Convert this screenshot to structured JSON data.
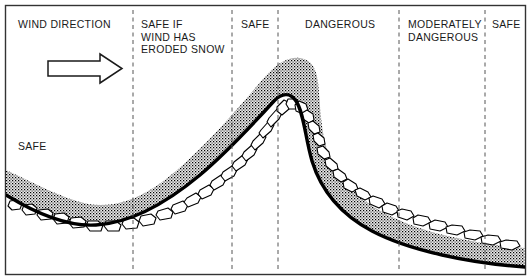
{
  "figure": {
    "frame": {
      "color": "#333333"
    },
    "colors": {
      "terrain_line": "#000000",
      "snow_fill": "#000000",
      "snow_pattern": "stipple",
      "rock_outline": "#000000",
      "divider": "#555555",
      "text": "#1a1a1a",
      "background": "#ffffff"
    },
    "zones": [
      {
        "id": "zone-wind-direction",
        "label": "WIND DIRECTION",
        "x": 18,
        "y": 18
      },
      {
        "id": "zone-safe-left",
        "label": "SAFE",
        "x": 18,
        "y": 140
      },
      {
        "id": "zone-safe-if-wind-eroded",
        "label": "SAFE IF\nWIND HAS\nERODED SNOW",
        "x": 141,
        "y": 18
      },
      {
        "id": "zone-safe-crest-approach",
        "label": "SAFE",
        "x": 241,
        "y": 18
      },
      {
        "id": "zone-dangerous",
        "label": "DANGEROUS",
        "x": 305,
        "y": 18
      },
      {
        "id": "zone-moderately-dangerous",
        "label": "MODERATELY\nDANGEROUS",
        "x": 408,
        "y": 18
      },
      {
        "id": "zone-safe-right",
        "label": "SAFE",
        "x": 492,
        "y": 18
      }
    ],
    "dividers": [
      {
        "id": "divider-1",
        "x": 133
      },
      {
        "id": "divider-2",
        "x": 232
      },
      {
        "id": "divider-3",
        "x": 278
      },
      {
        "id": "divider-4",
        "x": 399
      },
      {
        "id": "divider-5",
        "x": 485
      }
    ],
    "wind_arrow": {
      "direction": "right",
      "x1": 48,
      "x2": 122,
      "y": 68
    },
    "terrain": {
      "description": "Cross-section of a ridge: valley low on left, rising slope, crest with lee-side cornice, descending slope to the right.",
      "valley_bottom": {
        "x": 88,
        "y": 226
      },
      "crest": {
        "x": 286,
        "y": 92
      },
      "left_edge_elevation_y": 203,
      "right_edge_elevation_y": 252
    },
    "snow_layer": {
      "label": "snow cover",
      "thickness_px": 20,
      "cornice_side": "lee",
      "cornice_peak": {
        "x": 300,
        "y": 60
      }
    }
  }
}
